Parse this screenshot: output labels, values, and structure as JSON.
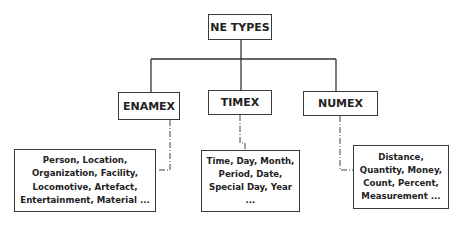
{
  "root": {
    "label": "NE TYPES"
  },
  "categories": [
    {
      "label": "ENAMEX",
      "details": [
        "Person, Location,",
        "Organization, Facility,",
        "Locomotive, Artefact,",
        "Entertainment, Material ..."
      ]
    },
    {
      "label": "TIMEX",
      "details": [
        "Time, Day, Month,",
        "Period, Date,",
        "Special Day, Year",
        "..."
      ]
    },
    {
      "label": "NUMEX",
      "details": [
        "Distance,",
        "Quantity, Money,",
        "Count, Percent,",
        "Measurement ..."
      ]
    }
  ]
}
